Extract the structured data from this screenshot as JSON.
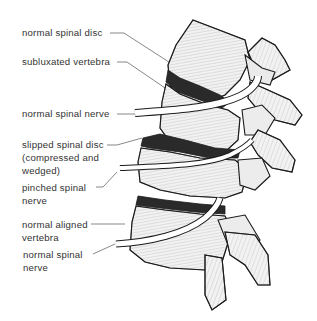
{
  "figure": {
    "labels": [
      {
        "id": "normal-spinal-disc",
        "lines": [
          "normal spinal disc"
        ]
      },
      {
        "id": "subluxated-vertebra",
        "lines": [
          "subluxated vertebra"
        ]
      },
      {
        "id": "normal-spinal-nerve-top",
        "lines": [
          "normal spinal nerve"
        ]
      },
      {
        "id": "slipped-spinal-disc",
        "lines": [
          "slipped spinal disc",
          "(compressed and",
          "wedged)"
        ]
      },
      {
        "id": "pinched-spinal-nerve",
        "lines": [
          "pinched spinal",
          "nerve"
        ]
      },
      {
        "id": "normal-aligned-vertebra",
        "lines": [
          "normal aligned",
          "vertebra"
        ]
      },
      {
        "id": "normal-spinal-nerve-bottom",
        "lines": [
          "normal spinal",
          "nerve"
        ]
      }
    ],
    "colors": {
      "ink": "#1a1a1a",
      "label_text": "#333333",
      "leader_line": "#555555",
      "bone_fill": "#f2f2f2",
      "disc_dark": "#2a2a2a",
      "background": "#ffffff"
    }
  }
}
